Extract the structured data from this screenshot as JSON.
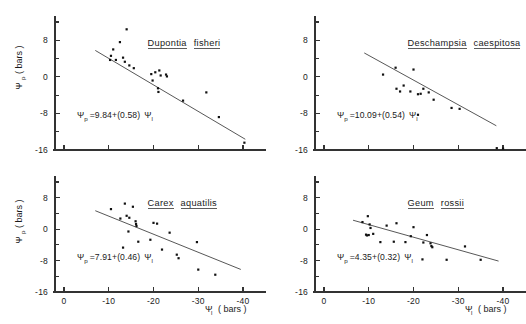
{
  "figure": {
    "type": "scatter-panel-grid",
    "background": "#ffffff",
    "ink_color": "#1a1a1a",
    "axis_color": "#333333",
    "point_color": "#111111",
    "shared_axis_labels": {
      "y_title_main": "Ψ",
      "y_title_sub": "p",
      "y_title_unit": "( bars )",
      "x_title_main": "Ψ",
      "x_title_sub": "l",
      "x_title_unit": "( bars )"
    }
  },
  "chart_data": [
    {
      "panel": 1,
      "position": "top-left",
      "type": "scatter",
      "title": "Dupontia fisheri",
      "title_parts": [
        "Dupontia",
        "fisheri"
      ],
      "annotation": "Ψp = 9.84 + (0.58) Ψl",
      "equation": {
        "lhs_main": "Ψ",
        "lhs_sub": "p",
        "operator": "=",
        "intercept": "9.84",
        "plus": "+",
        "slope": "(0.58)",
        "rhs_main": "Ψ",
        "rhs_sub": "l"
      },
      "fit": {
        "intercept": 9.84,
        "slope": 0.58
      },
      "xlabel": "",
      "ylabel": "",
      "xlim": [
        2,
        -42
      ],
      "ylim": [
        -16,
        12
      ],
      "xticks": [
        0,
        -10,
        -20,
        -30,
        -40
      ],
      "xticklabels": [
        "",
        "",
        "",
        "",
        ""
      ],
      "yticks": [
        8,
        0,
        -8,
        -16
      ],
      "yticklabels": [
        "8",
        "0",
        "-8",
        "-16"
      ],
      "yminorticks": [
        12,
        4,
        -4,
        -12
      ],
      "grid": false,
      "legend": "none",
      "fit_line_x": [
        -7.0,
        -40.5
      ],
      "points": [
        [
          -14.0,
          10.4
        ],
        [
          -12.5,
          7.6
        ],
        [
          -11.0,
          6.0
        ],
        [
          -10.5,
          4.6
        ],
        [
          -10.3,
          3.7
        ],
        [
          -11.6,
          3.7
        ],
        [
          -13.2,
          4.2
        ],
        [
          -13.6,
          3.3
        ],
        [
          -14.6,
          2.5
        ],
        [
          -15.6,
          1.9
        ],
        [
          -19.5,
          0.6
        ],
        [
          -19.8,
          -0.8
        ],
        [
          -20.4,
          1.0
        ],
        [
          -21.3,
          1.4
        ],
        [
          -21.6,
          0.3
        ],
        [
          -22.8,
          0.5
        ],
        [
          -21.0,
          -2.5
        ],
        [
          -21.1,
          -3.3
        ],
        [
          -23.0,
          0.1
        ],
        [
          -26.6,
          -5.2
        ],
        [
          -31.8,
          -3.4
        ],
        [
          -34.6,
          -8.8
        ],
        [
          -40.3,
          -14.4
        ]
      ]
    },
    {
      "panel": 2,
      "position": "top-right",
      "type": "scatter",
      "title": "Deschampsia caespitosa",
      "title_parts": [
        "Deschampsia",
        "caespitosa"
      ],
      "annotation": "Ψp = 10.09 + (0.54) Ψl",
      "equation": {
        "lhs_main": "Ψ",
        "lhs_sub": "p",
        "operator": "=",
        "intercept": "10.09",
        "plus": "+",
        "slope": "(0.54)",
        "rhs_main": "Ψ",
        "rhs_sub": "l"
      },
      "fit": {
        "intercept": 10.09,
        "slope": 0.54
      },
      "xlabel": "",
      "ylabel": "",
      "xlim": [
        2,
        -42
      ],
      "ylim": [
        -16,
        12
      ],
      "xticks": [
        0,
        -10,
        -20,
        -30,
        -40
      ],
      "xticklabels": [
        "",
        "",
        "",
        "",
        ""
      ],
      "yticks": [
        8,
        0,
        -8,
        -16
      ],
      "yticklabels": [
        "8",
        "0",
        "-8",
        "-16"
      ],
      "yminorticks": [
        12,
        4,
        -4,
        -12
      ],
      "grid": false,
      "legend": "none",
      "fit_line_x": [
        -9.0,
        -38.5
      ],
      "points": [
        [
          -13.2,
          0.5
        ],
        [
          -16.0,
          2.0
        ],
        [
          -20.0,
          1.6
        ],
        [
          -17.8,
          -1.9
        ],
        [
          -17.0,
          -3.2
        ],
        [
          -16.2,
          -2.6
        ],
        [
          -19.3,
          -3.2
        ],
        [
          -21.0,
          -3.8
        ],
        [
          -21.6,
          -3.7
        ],
        [
          -22.2,
          -2.6
        ],
        [
          -23.4,
          -3.4
        ],
        [
          -24.5,
          -5.0
        ],
        [
          -21.0,
          -8.3
        ],
        [
          -28.5,
          -6.8
        ],
        [
          -30.3,
          -7.0
        ],
        [
          -38.6,
          -15.6
        ],
        [
          -40.0,
          -15.7
        ]
      ]
    },
    {
      "panel": 3,
      "position": "bottom-left",
      "type": "scatter",
      "title": "Carex aquatilis",
      "title_parts": [
        "Carex",
        "aquatilis"
      ],
      "annotation": "Ψp = 7.91 + (0.46) Ψl",
      "equation": {
        "lhs_main": "Ψ",
        "lhs_sub": "p",
        "operator": "=",
        "intercept": "7.91",
        "plus": "+",
        "slope": "(0.46)",
        "rhs_main": "Ψ",
        "rhs_sub": "l"
      },
      "fit": {
        "intercept": 7.91,
        "slope": 0.46
      },
      "xlabel": "Ψl ( bars )",
      "ylabel": "Ψp ( bars )",
      "xlim": [
        2,
        -42
      ],
      "ylim": [
        -16,
        12
      ],
      "xticks": [
        0,
        -10,
        -20,
        -30,
        -40
      ],
      "xticklabels": [
        "0",
        "-10",
        "-20",
        "-30",
        "-40"
      ],
      "yticks": [
        8,
        0,
        -8,
        -16
      ],
      "yticklabels": [
        "8",
        "0",
        "-8",
        "-16"
      ],
      "yminorticks": [
        12,
        4,
        -4,
        -12
      ],
      "grid": false,
      "legend": "none",
      "fit_line_x": [
        -7.0,
        -39.5
      ],
      "points": [
        [
          -10.5,
          5.1
        ],
        [
          -13.6,
          6.5
        ],
        [
          -14.0,
          3.4
        ],
        [
          -15.4,
          5.7
        ],
        [
          -12.6,
          2.7
        ],
        [
          -14.6,
          2.9
        ],
        [
          -16.0,
          2.0
        ],
        [
          -16.1,
          1.3
        ],
        [
          -16.2,
          0.8
        ],
        [
          -14.4,
          -0.6
        ],
        [
          -20.0,
          1.6
        ],
        [
          -20.8,
          1.4
        ],
        [
          -16.6,
          -3.2
        ],
        [
          -13.2,
          -4.7
        ],
        [
          -19.3,
          -2.7
        ],
        [
          -21.9,
          -5.2
        ],
        [
          -23.6,
          -0.9
        ],
        [
          -25.2,
          -6.5
        ],
        [
          -25.6,
          -7.4
        ],
        [
          -29.7,
          -3.3
        ],
        [
          -30.0,
          -10.3
        ],
        [
          -33.8,
          -11.6
        ]
      ]
    },
    {
      "panel": 4,
      "position": "bottom-right",
      "type": "scatter",
      "title": "Geum rossii",
      "title_parts": [
        "Geum",
        "rossii"
      ],
      "annotation": "Ψp = 4.35 + (0.32) Ψl",
      "equation": {
        "lhs_main": "Ψ",
        "lhs_sub": "p",
        "operator": "=",
        "intercept": "4.35",
        "plus": "+",
        "slope": "(0.32)",
        "rhs_main": "Ψ",
        "rhs_sub": "l"
      },
      "fit": {
        "intercept": 4.35,
        "slope": 0.32
      },
      "xlabel": "Ψl ( bars )",
      "ylabel": "",
      "xlim": [
        2,
        -42
      ],
      "ylim": [
        -16,
        12
      ],
      "xticks": [
        0,
        -10,
        -20,
        -30,
        -40
      ],
      "xticklabels": [
        "0",
        "-10",
        "-20",
        "-30",
        "-40"
      ],
      "yticks": [
        8,
        0,
        -8,
        -16
      ],
      "yticklabels": [
        "8",
        "0",
        "-8",
        "-16"
      ],
      "yminorticks": [
        12,
        4,
        -4,
        -12
      ],
      "grid": false,
      "legend": "none",
      "fit_line_x": [
        -6.5,
        -39.0
      ],
      "points": [
        [
          -8.6,
          1.8
        ],
        [
          -9.8,
          3.3
        ],
        [
          -10.2,
          1.2
        ],
        [
          -10.4,
          0.3
        ],
        [
          -9.4,
          -1.4
        ],
        [
          -9.6,
          -1.6
        ],
        [
          -10.0,
          -1.5
        ],
        [
          -11.0,
          -1.2
        ],
        [
          -14.0,
          0.9
        ],
        [
          -16.2,
          1.5
        ],
        [
          -12.6,
          -3.3
        ],
        [
          -15.6,
          -3.2
        ],
        [
          -18.2,
          -3.3
        ],
        [
          -19.4,
          -1.8
        ],
        [
          -20.0,
          0.5
        ],
        [
          -22.2,
          -3.4
        ],
        [
          -23.0,
          -1.5
        ],
        [
          -23.8,
          -3.6
        ],
        [
          -24.0,
          -4.3
        ],
        [
          -24.2,
          -4.6
        ],
        [
          -22.0,
          -7.7
        ],
        [
          -27.4,
          -7.8
        ],
        [
          -31.5,
          -4.4
        ],
        [
          -35.0,
          -7.8
        ]
      ]
    }
  ]
}
